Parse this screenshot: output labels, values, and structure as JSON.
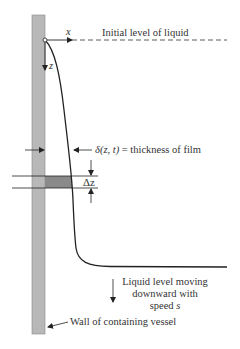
{
  "diagram": {
    "labels": {
      "x_axis": "x",
      "z_axis": "z",
      "initial_level": "Initial level of liquid",
      "film_thickness_symbol": "δ(z, t)",
      "film_thickness_text": " = thickness of film",
      "delta_z": "Δz",
      "moving_line1": "Liquid level moving",
      "moving_line2": "downward with",
      "moving_line3_prefix": "speed ",
      "moving_line3_var": "s",
      "wall": "Wall of containing vessel"
    },
    "colors": {
      "wall_fill": "#b8b8b8",
      "element_fill": "#8a8a8a",
      "line": "#222222"
    }
  }
}
